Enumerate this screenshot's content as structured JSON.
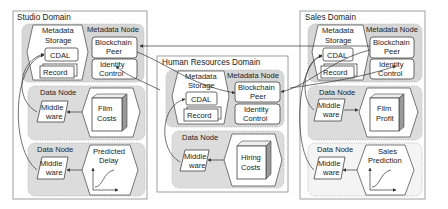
{
  "diagram": {
    "domains": [
      {
        "id": "studio",
        "title": "Studio Domain",
        "metadata_node": {
          "label": "Metadata Node",
          "storage_label_1": "Metadata",
          "storage_label_2": "Storage",
          "cdal": "CDAL",
          "record": "Record",
          "blockchain_1": "Blockchain",
          "blockchain_2": "Peer",
          "identity_1": "Identity",
          "identity_2": "Control"
        },
        "data_nodes": [
          {
            "label": "Data Node",
            "middleware_1": "Middle",
            "middleware_2": "ware",
            "resource_1": "Film",
            "resource_2": "Costs",
            "resource_type": "cube"
          },
          {
            "label": "Data Node",
            "middleware_1": "Middle",
            "middleware_2": "ware",
            "resource_1": "Predicted",
            "resource_2": "Delay",
            "resource_type": "model-curve"
          }
        ]
      },
      {
        "id": "hr",
        "title": "Human Resources Domain",
        "metadata_node": {
          "label": "Metadata Node",
          "storage_label_1": "Metadata",
          "storage_label_2": "Storage",
          "cdal": "CDAL",
          "record": "Record",
          "blockchain_1": "Blockchain",
          "blockchain_2": "Peer",
          "identity_1": "Identity",
          "identity_2": "Control"
        },
        "data_nodes": [
          {
            "label": "Data Node",
            "middleware_1": "Middle",
            "middleware_2": "ware",
            "resource_1": "Hiring",
            "resource_2": "Costs",
            "resource_type": "cube"
          }
        ]
      },
      {
        "id": "sales",
        "title": "Sales Domain",
        "metadata_node": {
          "label": "Metadata Node",
          "storage_label_1": "Metadata",
          "storage_label_2": "Storage",
          "cdal": "CDAL",
          "record": "Record",
          "blockchain_1": "Blockchain",
          "blockchain_2": "Peer",
          "identity_1": "Identity",
          "identity_2": "Control"
        },
        "data_nodes": [
          {
            "label": "Data Node",
            "middleware_1": "Middle",
            "middleware_2": "ware",
            "resource_1": "Film",
            "resource_2": "Profit",
            "resource_type": "cube"
          },
          {
            "label": "Data Node",
            "middleware_1": "Middle",
            "middleware_2": "ware",
            "resource_1": "Sales",
            "resource_2": "Prediction",
            "resource_type": "model-curve"
          }
        ]
      }
    ],
    "colors": {
      "panel_grey": "#d6d6d6",
      "panel_light": "#f4f4f4",
      "stroke": "#444444",
      "domain_border": "#888888"
    }
  }
}
